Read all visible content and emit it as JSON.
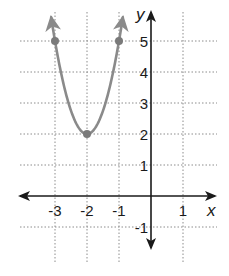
{
  "chart_data": {
    "type": "line",
    "title": "",
    "xlabel": "x",
    "ylabel": "y",
    "xlim": [
      -3.5,
      2
    ],
    "ylim": [
      -1.5,
      5.5
    ],
    "grid": true,
    "grid_style": "dotted",
    "x_ticks": [
      {
        "value": -3,
        "label": "-3"
      },
      {
        "value": -2,
        "label": "-2"
      },
      {
        "value": -1,
        "label": "-1"
      },
      {
        "value": 1,
        "label": "1"
      }
    ],
    "y_ticks": [
      {
        "value": 5,
        "label": "5"
      },
      {
        "value": 4,
        "label": "4"
      },
      {
        "value": 3,
        "label": "3"
      },
      {
        "value": 2,
        "label": "2"
      },
      {
        "value": 1,
        "label": "1"
      },
      {
        "value": -1,
        "label": "-1"
      }
    ],
    "series": [
      {
        "name": "parabola",
        "equation": "y = 3(x + 2)^2 + 2",
        "color": "#8a8a8a",
        "vertex": [
          -2,
          2
        ],
        "marked_points": [
          [
            -3,
            5
          ],
          [
            -2,
            2
          ],
          [
            -1,
            5
          ]
        ],
        "arrows_at_ends": true
      }
    ]
  },
  "colors": {
    "axis": "#1a1a1a",
    "grid": "#8c8c8c",
    "curve": "#8a8a8a",
    "point": "#7a7a7a"
  }
}
